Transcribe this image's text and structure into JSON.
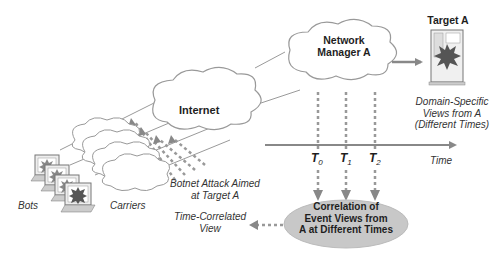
{
  "diagram": {
    "nodes": {
      "internet": {
        "label": "Internet"
      },
      "network_manager": {
        "line1": "Network",
        "line2": "Manager A"
      },
      "target": {
        "label": "Target A"
      },
      "correlation": {
        "line1": "Correlation of",
        "line2": "Event Views from",
        "line3": "A at Different Times"
      },
      "bots": {
        "label": "Bots"
      },
      "carriers": {
        "label": "Carriers"
      }
    },
    "annotations": {
      "domain_views": {
        "line1": "Domain-Specific",
        "line2": "Views from A",
        "line3": "(Different Times)"
      },
      "botnet_attack": {
        "line1": "Botnet Attack Aimed",
        "line2": "at Target A"
      },
      "time_correlated": {
        "line1": "Time-Correlated",
        "line2": "View"
      },
      "time_axis": {
        "label": "Time"
      }
    },
    "time_points": [
      {
        "letter": "T",
        "sub": "0"
      },
      {
        "letter": "T",
        "sub": "1"
      },
      {
        "letter": "T",
        "sub": "2"
      }
    ],
    "colors": {
      "line": "#8a8a8a",
      "arrow": "#888888",
      "ellipse_fill": "#c8c8c8",
      "cloud_stroke": "#999999",
      "burst": "#555555"
    }
  }
}
